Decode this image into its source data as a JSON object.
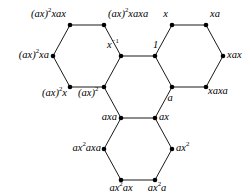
{
  "figure": {
    "name": "cayley-graph-hexagons",
    "background_color": "#ffffff",
    "edge_color_thin": "#1a1a1a",
    "edge_color_thick": "#8c8c8c",
    "vertex_color": "#000000",
    "width": 251,
    "height": 196
  },
  "vertices": [
    {
      "id": "v-ax2xax",
      "label_html": "(ax)<sup>2</sup><span class=\"up-it\">xax</span>",
      "label_text": "(ax)^2 xax",
      "x": 70,
      "y": 25,
      "lx": 66,
      "ly": 14,
      "align": "lbl-r"
    },
    {
      "id": "v-ax2xaxa",
      "label_html": "(ax)<sup>2</sup><span class=\"up-it\">xaxa</span>",
      "label_text": "(ax)^2 xaxa",
      "x": 104,
      "y": 25,
      "lx": 108,
      "ly": 14,
      "align": "lbl-l"
    },
    {
      "id": "v-ax2xa",
      "label_html": "(ax)<sup>2</sup><span class=\"up-it\">xa</span>",
      "label_text": "(ax)^2 xa",
      "x": 53,
      "y": 56,
      "lx": 49,
      "ly": 55,
      "align": "lbl-r"
    },
    {
      "id": "v-xinv",
      "label_html": "x<sup>&#8722;1</sup>",
      "label_text": "x^-1",
      "x": 121,
      "y": 56,
      "lx": 119,
      "ly": 45,
      "align": "lbl-r"
    },
    {
      "id": "v-ax2x",
      "label_html": "(ax)<sup>2</sup><span class=\"up-it\">x</span>",
      "label_text": "(ax)^2 x",
      "x": 70,
      "y": 87,
      "lx": 67,
      "ly": 93,
      "align": "lbl-r"
    },
    {
      "id": "v-ax2",
      "label_html": "(ax)<sup>2</sup>",
      "label_text": "(ax)^2",
      "x": 104,
      "y": 87,
      "lx": 78,
      "ly": 93,
      "align": "lbl-l"
    },
    {
      "id": "v-one",
      "label_html": "1",
      "label_text": "1",
      "x": 155,
      "y": 56,
      "lx": 153,
      "ly": 45,
      "align": "lbl-l"
    },
    {
      "id": "v-x",
      "label_html": "x",
      "label_text": "x",
      "x": 172,
      "y": 25,
      "lx": 168,
      "ly": 14,
      "align": "lbl-r"
    },
    {
      "id": "v-xa",
      "label_html": "<span class=\"up-it\">xa</span>",
      "label_text": "xa",
      "x": 206,
      "y": 25,
      "lx": 210,
      "ly": 14,
      "align": "lbl-l"
    },
    {
      "id": "v-xax",
      "label_html": "<span class=\"up-it\">xax</span>",
      "label_text": "xax",
      "x": 223,
      "y": 56,
      "lx": 227,
      "ly": 55,
      "align": "lbl-l"
    },
    {
      "id": "v-xaxa",
      "label_html": "<span class=\"up-it\">xaxa</span>",
      "label_text": "xaxa",
      "x": 206,
      "y": 87,
      "lx": 208,
      "ly": 91,
      "align": "lbl-l"
    },
    {
      "id": "v-a",
      "label_html": "a",
      "label_text": "a",
      "x": 172,
      "y": 87,
      "lx": 170,
      "ly": 98,
      "align": "lbl-c"
    },
    {
      "id": "v-axa",
      "label_html": "<span class=\"up-it\">axa</span>",
      "label_text": "axa",
      "x": 121,
      "y": 118,
      "lx": 117,
      "ly": 117,
      "align": "lbl-r"
    },
    {
      "id": "v-ax",
      "label_html": "<span class=\"up-it\">ax</span>",
      "label_text": "ax",
      "x": 155,
      "y": 118,
      "lx": 159,
      "ly": 117,
      "align": "lbl-l"
    },
    {
      "id": "v-ax2axa",
      "label_html": "ax<sup>2</sup><span class=\"up-it\">axa</span>",
      "label_text": "ax^2 axa",
      "x": 104,
      "y": 149,
      "lx": 101,
      "ly": 148,
      "align": "lbl-r"
    },
    {
      "id": "v-ax2sq",
      "label_html": "ax<sup>2</sup>",
      "label_text": "ax^2",
      "x": 172,
      "y": 149,
      "lx": 176,
      "ly": 148,
      "align": "lbl-l"
    },
    {
      "id": "v-ax2ax",
      "label_html": "ax<sup>2</sup><span class=\"up-it\">ax</span>",
      "label_text": "ax^2 ax",
      "x": 121,
      "y": 180,
      "lx": 121,
      "ly": 188,
      "align": "lbl-c"
    },
    {
      "id": "v-ax2a",
      "label_html": "ax<sup>2</sup><span class=\"up-it\">a</span>",
      "label_text": "ax^2 a",
      "x": 155,
      "y": 180,
      "lx": 157,
      "ly": 188,
      "align": "lbl-c"
    }
  ],
  "edges": [
    {
      "id": "e-ax2xax--ax2xaxa",
      "from": "v-ax2xax",
      "to": "v-ax2xaxa",
      "kind": "thick"
    },
    {
      "id": "e-ax2xax--ax2xa",
      "from": "v-ax2xax",
      "to": "v-ax2xa",
      "kind": "thin"
    },
    {
      "id": "e-ax2xaxa--xinv",
      "from": "v-ax2xaxa",
      "to": "v-xinv",
      "kind": "thin"
    },
    {
      "id": "e-ax2xa--ax2x",
      "from": "v-ax2xa",
      "to": "v-ax2x",
      "kind": "thin"
    },
    {
      "id": "e-xinv--ax2",
      "from": "v-xinv",
      "to": "v-ax2",
      "kind": "thin"
    },
    {
      "id": "e-ax2x--ax2",
      "from": "v-ax2x",
      "to": "v-ax2",
      "kind": "thick"
    },
    {
      "id": "e-xinv--one",
      "from": "v-xinv",
      "to": "v-one",
      "kind": "thick"
    },
    {
      "id": "e-x--xa",
      "from": "v-x",
      "to": "v-xa",
      "kind": "thick"
    },
    {
      "id": "e-one--x",
      "from": "v-one",
      "to": "v-x",
      "kind": "thin"
    },
    {
      "id": "e-xa--xax",
      "from": "v-xa",
      "to": "v-xax",
      "kind": "thin"
    },
    {
      "id": "e-one--a",
      "from": "v-one",
      "to": "v-a",
      "kind": "thin"
    },
    {
      "id": "e-xax--xaxa",
      "from": "v-xax",
      "to": "v-xaxa",
      "kind": "thin"
    },
    {
      "id": "e-a--xaxa",
      "from": "v-a",
      "to": "v-xaxa",
      "kind": "thick"
    },
    {
      "id": "e-ax2--axa",
      "from": "v-ax2",
      "to": "v-axa",
      "kind": "thin"
    },
    {
      "id": "e-a--ax",
      "from": "v-a",
      "to": "v-ax",
      "kind": "thin"
    },
    {
      "id": "e-axa--ax",
      "from": "v-axa",
      "to": "v-ax",
      "kind": "thick"
    },
    {
      "id": "e-axa--ax2axa",
      "from": "v-axa",
      "to": "v-ax2axa",
      "kind": "thin"
    },
    {
      "id": "e-ax--ax2sq",
      "from": "v-ax",
      "to": "v-ax2sq",
      "kind": "thin"
    },
    {
      "id": "e-ax2axa--ax2ax",
      "from": "v-ax2axa",
      "to": "v-ax2ax",
      "kind": "thin"
    },
    {
      "id": "e-ax2sq--ax2a",
      "from": "v-ax2sq",
      "to": "v-ax2a",
      "kind": "thin"
    },
    {
      "id": "e-ax2ax--ax2a",
      "from": "v-ax2ax",
      "to": "v-ax2a",
      "kind": "thick"
    }
  ]
}
